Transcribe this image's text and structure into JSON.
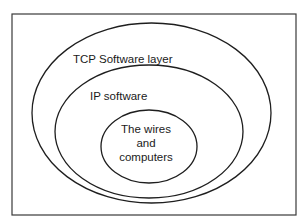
{
  "diagram": {
    "type": "nested-ellipses",
    "colors": {
      "stroke": "#1e1e1e",
      "text": "#1a1a1a",
      "background": "#ffffff"
    },
    "layers": [
      {
        "label": "TCP Software layer"
      },
      {
        "label": "IP software"
      },
      {
        "label_lines": [
          "The wires",
          "and",
          "computers"
        ]
      }
    ]
  }
}
